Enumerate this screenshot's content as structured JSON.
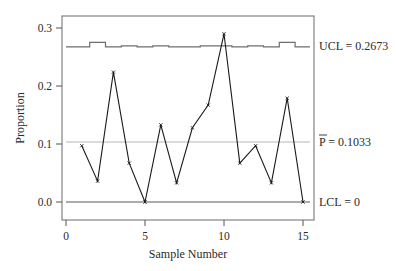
{
  "chart_data": {
    "type": "line",
    "title": "",
    "xlabel": "Sample Number",
    "ylabel": "Proportion",
    "xlim": [
      0,
      15.8
    ],
    "ylim": [
      -0.03,
      0.32
    ],
    "x_ticks": [
      "0",
      "5",
      "10",
      "15"
    ],
    "y_ticks": [
      "0.0",
      "0.1",
      "0.2",
      "0.3"
    ],
    "grid": false,
    "x": [
      1,
      2,
      3,
      4,
      5,
      6,
      7,
      8,
      9,
      10,
      11,
      12,
      13,
      14,
      15
    ],
    "series": [
      {
        "name": "Proportion",
        "values": [
          0.097,
          0.036,
          0.224,
          0.067,
          0.0,
          0.133,
          0.033,
          0.128,
          0.167,
          0.29,
          0.067,
          0.097,
          0.033,
          0.179,
          0.0
        ]
      },
      {
        "name": "UCL",
        "values": [
          0.2673,
          0.2753,
          0.2673,
          0.2693,
          0.2673,
          0.2693,
          0.2673,
          0.2673,
          0.2693,
          0.2693,
          0.2673,
          0.2693,
          0.2673,
          0.2753,
          0.2673
        ]
      }
    ],
    "reference_lines": [
      {
        "name": "UCL",
        "label": "UCL = 0.2673",
        "value": 0.2673
      },
      {
        "name": "center",
        "label": "P = 0.1033",
        "value": 0.1033,
        "overline": "P"
      },
      {
        "name": "LCL",
        "label": "LCL = 0",
        "value": 0
      }
    ]
  },
  "labels": {
    "ucl": "UCL = 0.2673",
    "center_symbol": "P",
    "center_value": " = 0.1033",
    "lcl": "LCL = 0",
    "xlabel": "Sample Number",
    "ylabel": "Proportion",
    "x_ticks": [
      "0",
      "5",
      "10",
      "15"
    ],
    "y_ticks": [
      "0.0",
      "0.1",
      "0.2",
      "0.3"
    ]
  },
  "colors": {
    "data_line": "#1a1a1a",
    "ucl_line": "#6e6e6e",
    "center_line": "#b8b8b8",
    "lcl_line": "#5a5a5a",
    "frame": "#6a6a6a"
  }
}
